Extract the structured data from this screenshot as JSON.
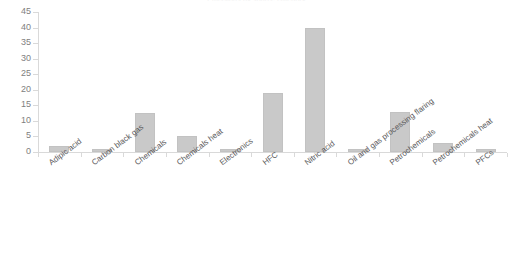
{
  "chart_data": {
    "type": "bar",
    "title": "Emissions by source category",
    "xlabel": "",
    "ylabel": "",
    "ylim": [
      0,
      45
    ],
    "ytick_step": 5,
    "yticks": [
      0,
      5,
      10,
      15,
      20,
      25,
      30,
      35,
      40,
      45
    ],
    "ytick_labels": [
      "0",
      "5",
      "10",
      "15",
      "20",
      "25",
      "30",
      "35",
      "40",
      "45"
    ],
    "grid": false,
    "legend": "none",
    "bar_color": "#c9c9c9",
    "axis_color": "#d9d9d9",
    "label_color": "#59595b",
    "categories": [
      "Adipic acid",
      "Carbon black gas",
      "Chemicals",
      "Chemicals heat",
      "Electronics",
      "HFC",
      "Nitric acid",
      "Oil and gas processing flaring",
      "Petrochemicals",
      "Petrochemicals heat",
      "PFCs"
    ],
    "values": [
      2,
      1,
      12.5,
      5,
      1,
      19,
      40,
      1,
      13,
      3,
      1
    ]
  }
}
